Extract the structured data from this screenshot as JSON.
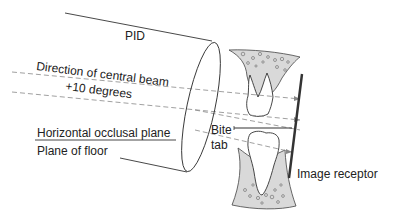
{
  "diagram": {
    "labels": {
      "pid": "PID",
      "direction": "Direction of central beam",
      "angle": "+10 degrees",
      "occlusal_plane": "Horizontal occlusal plane",
      "floor_plane": "Plane of floor",
      "bite": "Bite",
      "tab": "tab",
      "receptor": "Image receptor"
    },
    "colors": {
      "line": "#333333",
      "bone": "#d9d9d9",
      "dash": "#888888"
    }
  }
}
